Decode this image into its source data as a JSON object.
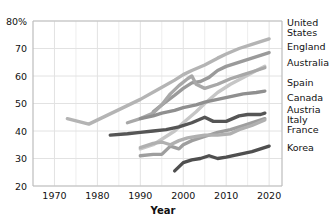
{
  "chart_data": {
    "type": "line",
    "title": "",
    "xlabel": "Year",
    "ylabel": "",
    "xlim": [
      1965,
      2023
    ],
    "ylim": [
      20,
      80
    ],
    "grid": true,
    "legend_position": "right-inline-end-labels",
    "x_ticks": [
      "1970",
      "1980",
      "1990",
      "2000",
      "2010",
      "2020"
    ],
    "x_tick_values": [
      1970,
      1980,
      1990,
      2000,
      2010,
      2020
    ],
    "x_minor_ticks": [
      1965,
      1975,
      1985,
      1995,
      2005,
      2015
    ],
    "y_ticks": [
      "20",
      "30",
      "40",
      "50",
      "60",
      "70",
      "80%"
    ],
    "y_tick_values": [
      20,
      30,
      40,
      50,
      60,
      70,
      80
    ],
    "series": [
      {
        "name": "United States",
        "color": "#b4b4b4",
        "x": [
          1973,
          1978,
          1982,
          1986,
          1990,
          1994,
          1998,
          2000,
          2002,
          2005,
          2008,
          2010,
          2013,
          2016,
          2018,
          2020
        ],
        "values": [
          44.5,
          42.5,
          45.5,
          48.5,
          51.5,
          55.0,
          58.5,
          60.5,
          62.0,
          64.0,
          66.5,
          68.0,
          70.0,
          71.5,
          72.5,
          73.5
        ]
      },
      {
        "name": "England",
        "color": "#9a9a9a",
        "x": [
          1993,
          1995,
          1998,
          2000,
          2002,
          2004,
          2006,
          2008,
          2010,
          2012,
          2014,
          2016,
          2018,
          2020
        ],
        "values": [
          47.0,
          49.5,
          53.0,
          55.5,
          57.5,
          58.0,
          59.5,
          62.0,
          63.5,
          64.5,
          65.5,
          66.5,
          67.5,
          68.5
        ]
      },
      {
        "name": "Australia",
        "color": "#c6c6c6",
        "x": [
          1990,
          1993,
          1995,
          1998,
          2000,
          2003,
          2005,
          2008,
          2011,
          2014,
          2017,
          2019
        ],
        "values": [
          33.5,
          35.0,
          37.0,
          40.0,
          43.0,
          47.0,
          50.0,
          54.0,
          57.0,
          59.5,
          62.0,
          63.5
        ]
      },
      {
        "name": "Spain",
        "color": "#a8a8a8",
        "x": [
          1987,
          1990,
          1993,
          1995,
          1997,
          1999,
          2001,
          2002,
          2003,
          2005,
          2008,
          2011,
          2014,
          2017,
          2019
        ],
        "values": [
          43.0,
          44.5,
          46.5,
          49.5,
          53.5,
          56.5,
          59.0,
          60.0,
          57.0,
          55.5,
          57.0,
          59.0,
          60.5,
          62.0,
          63.0
        ]
      },
      {
        "name": "Canada",
        "color": "#8f8f8f",
        "x": [
          1990,
          1993,
          1995,
          1998,
          2000,
          2003,
          2005,
          2008,
          2011,
          2014,
          2017,
          2019
        ],
        "values": [
          44.5,
          45.5,
          46.5,
          47.5,
          48.5,
          49.5,
          50.5,
          51.5,
          52.5,
          53.5,
          54.0,
          54.5
        ]
      },
      {
        "name": "Austria",
        "color": "#555555",
        "x": [
          1983,
          1987,
          1990,
          1993,
          1996,
          1999,
          2002,
          2005,
          2007,
          2010,
          2013,
          2015,
          2018,
          2019
        ],
        "values": [
          38.5,
          39.0,
          39.5,
          40.0,
          40.5,
          41.5,
          43.0,
          45.0,
          43.5,
          43.5,
          45.5,
          46.0,
          46.0,
          46.5
        ]
      },
      {
        "name": "Italy",
        "color": "#9e9e9e",
        "x": [
          1990,
          1993,
          1995,
          1997,
          1999,
          2000,
          2002,
          2005,
          2008,
          2011,
          2014,
          2017,
          2019
        ],
        "values": [
          31.0,
          31.5,
          31.5,
          34.5,
          33.5,
          35.0,
          36.5,
          38.0,
          39.5,
          40.5,
          42.0,
          43.5,
          44.5
        ]
      },
      {
        "name": "France",
        "color": "#b0b0b0",
        "x": [
          1990,
          1993,
          1995,
          1997,
          1999,
          2001,
          2003,
          2005,
          2008,
          2011,
          2013,
          2016,
          2019
        ],
        "values": [
          34.0,
          35.5,
          36.0,
          35.0,
          36.5,
          37.5,
          38.0,
          38.5,
          38.5,
          39.0,
          40.5,
          42.0,
          44.0
        ]
      },
      {
        "name": "Korea",
        "color": "#4f4f4f",
        "x": [
          1998,
          2000,
          2002,
          2004,
          2006,
          2008,
          2010,
          2013,
          2016,
          2018,
          2020
        ],
        "values": [
          25.5,
          28.5,
          29.5,
          30.0,
          31.0,
          30.0,
          30.5,
          31.5,
          32.5,
          33.5,
          34.5
        ]
      }
    ],
    "legend_labels": [
      {
        "label": "United",
        "group": "United States"
      },
      {
        "label": "States",
        "group": "United States"
      },
      {
        "label": "England",
        "group": "England"
      },
      {
        "label": "Australia",
        "group": "Australia"
      },
      {
        "label": "Spain",
        "group": "Spain"
      },
      {
        "label": "Canada",
        "group": "Canada"
      },
      {
        "label": "Austria",
        "group": "Austria"
      },
      {
        "label": "Italy",
        "group": "Italy"
      },
      {
        "label": "France",
        "group": "France"
      },
      {
        "label": "Korea",
        "group": "Korea"
      }
    ]
  }
}
